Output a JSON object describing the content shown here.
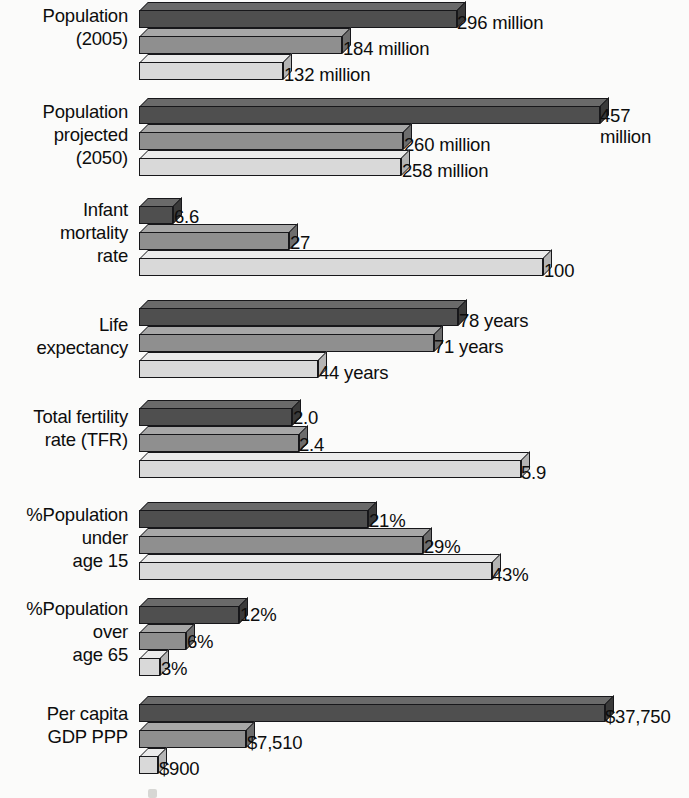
{
  "chart_data": {
    "type": "bar",
    "orientation": "horizontal",
    "title": "",
    "subtitle": "",
    "xlabel": "",
    "ylabel": "",
    "grid": false,
    "legend": null,
    "style": "3d-grouped-horizontal-bars",
    "scaling": "per-category (each demographic indicator uses its own horizontal scale)",
    "series": [
      {
        "name": "series-1",
        "shade": "dark-gray",
        "color": "#4f4f4f"
      },
      {
        "name": "series-2",
        "shade": "medium-gray",
        "color": "#8f8f8f"
      },
      {
        "name": "series-3",
        "shade": "light-gray",
        "color": "#d9d9d9"
      }
    ],
    "categories": [
      "Population (2005)",
      "Population projected (2050)",
      "Infant mortality rate",
      "Life expectancy",
      "Total fertility rate (TFR)",
      "%Population under age 15",
      "%Population over age 65",
      "Per capita GDP PPP"
    ],
    "values": [
      [
        296,
        184,
        132
      ],
      [
        457,
        260,
        258
      ],
      [
        6.6,
        27,
        100
      ],
      [
        78,
        71,
        44
      ],
      [
        2.0,
        2.4,
        5.9
      ],
      [
        21,
        29,
        43
      ],
      [
        12,
        6,
        3
      ],
      [
        37750,
        7510,
        900
      ]
    ],
    "value_labels": [
      [
        "296 million",
        "184 million",
        "132 million"
      ],
      [
        "457\nmillion",
        "260 million",
        "258 million"
      ],
      [
        "6.6",
        "27",
        "100"
      ],
      [
        "78 years",
        "71 years",
        "44 years"
      ],
      [
        "2.0",
        "2.4",
        "5.9"
      ],
      [
        "21%",
        "29%",
        "43%"
      ],
      [
        "12%",
        "6%",
        "3%"
      ],
      [
        "$37,750",
        "$7,510",
        "$900"
      ]
    ]
  },
  "groups": [
    {
      "label": "Population\n(2005)",
      "label_top": 4,
      "top": 0,
      "bars": [
        {
          "len": 318,
          "top": 2,
          "label": "296 million",
          "lx": 457,
          "ly": 12
        },
        {
          "len": 203,
          "top": 28,
          "label": "184 million",
          "lx": 343,
          "ly": 38
        },
        {
          "len": 144,
          "top": 54,
          "label": "132 million",
          "lx": 284,
          "ly": 64
        }
      ]
    },
    {
      "label": "Population\nprojected\n(2050)",
      "label_top": 100,
      "top": 96,
      "bars": [
        {
          "len": 461,
          "top": 2,
          "label": "457\nmillion",
          "lx": 600,
          "ly": 9
        },
        {
          "len": 264,
          "top": 28,
          "label": "260 million",
          "lx": 404,
          "ly": 38
        },
        {
          "len": 262,
          "top": 54,
          "label": "258 million",
          "lx": 402,
          "ly": 64
        }
      ]
    },
    {
      "label": "Infant\nmortality\nrate",
      "label_top": 198,
      "top": 196,
      "bars": [
        {
          "len": 34,
          "top": 2,
          "label": "6.6",
          "lx": 174,
          "ly": 10
        },
        {
          "len": 150,
          "top": 28,
          "label": "27",
          "lx": 290,
          "ly": 36
        },
        {
          "len": 404,
          "top": 54,
          "label": "100",
          "lx": 544,
          "ly": 64
        }
      ]
    },
    {
      "label": "Life\nexpectancy",
      "label_top": 313,
      "top": 298,
      "bars": [
        {
          "len": 319,
          "top": 2,
          "label": "78 years",
          "lx": 459,
          "ly": 12
        },
        {
          "len": 295,
          "top": 28,
          "label": "71 years",
          "lx": 434,
          "ly": 38
        },
        {
          "len": 179,
          "top": 54,
          "label": "44 years",
          "lx": 319,
          "ly": 64
        }
      ]
    },
    {
      "label": "Total fertility\nrate (TFR)",
      "label_top": 405,
      "top": 398,
      "bars": [
        {
          "len": 153,
          "top": 2,
          "label": "2.0",
          "lx": 293,
          "ly": 9
        },
        {
          "len": 160,
          "top": 28,
          "label": "2.4",
          "lx": 299,
          "ly": 36
        },
        {
          "len": 382,
          "top": 54,
          "label": "5.9",
          "lx": 521,
          "ly": 64
        }
      ]
    },
    {
      "label": "%Population\nunder\nage 15",
      "label_top": 503,
      "top": 500,
      "bars": [
        {
          "len": 229,
          "top": 2,
          "label": "21%",
          "lx": 369,
          "ly": 10
        },
        {
          "len": 284,
          "top": 28,
          "label": "29%",
          "lx": 424,
          "ly": 36
        },
        {
          "len": 353,
          "top": 54,
          "label": "43%",
          "lx": 492,
          "ly": 64
        }
      ]
    },
    {
      "label": "%Population\nover\nage 65",
      "label_top": 597,
      "top": 596,
      "bars": [
        {
          "len": 100,
          "top": 2,
          "label": "12%",
          "lx": 240,
          "ly": 8
        },
        {
          "len": 47,
          "top": 28,
          "label": "6%",
          "lx": 187,
          "ly": 35
        },
        {
          "len": 21,
          "top": 54,
          "label": "3%",
          "lx": 161,
          "ly": 62
        }
      ]
    },
    {
      "label": "Per capita\nGDP PPP",
      "label_top": 702,
      "top": 694,
      "bars": [
        {
          "len": 466,
          "top": 2,
          "label": "$37,750",
          "lx": 605,
          "ly": 12
        },
        {
          "len": 107,
          "top": 28,
          "label": "$7,510",
          "lx": 247,
          "ly": 38
        },
        {
          "len": 19,
          "top": 54,
          "label": "$900",
          "lx": 159,
          "ly": 64
        }
      ]
    }
  ],
  "geometry": {
    "bar_left": 130,
    "depth": 9,
    "bar_height": 18
  }
}
